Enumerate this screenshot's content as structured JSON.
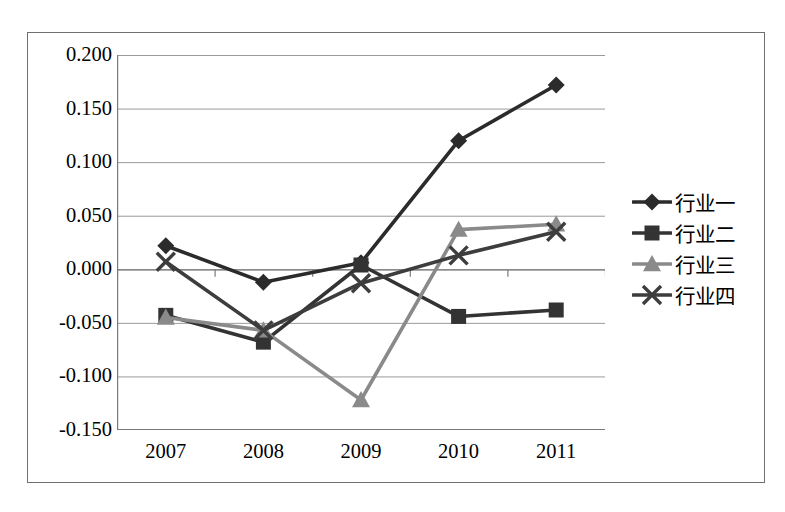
{
  "chart_data": {
    "type": "line",
    "title": "",
    "xlabel": "",
    "ylabel": "",
    "categories": [
      "2007",
      "2008",
      "2009",
      "2010",
      "2011"
    ],
    "ylim": [
      -0.15,
      0.2
    ],
    "ytick_step": 0.05,
    "ytick_labels": [
      "0.200",
      "0.150",
      "0.100",
      "0.050",
      "0.000",
      "-0.050",
      "-0.100",
      "-0.150"
    ],
    "ytick_values": [
      0.2,
      0.15,
      0.1,
      0.05,
      0.0,
      -0.05,
      -0.1,
      -0.15
    ],
    "grid": true,
    "legend_position": "right",
    "series": [
      {
        "name": "行业一",
        "marker": "diamond",
        "color": "#2b2b2b",
        "values": [
          0.022,
          -0.012,
          0.006,
          0.12,
          0.172
        ]
      },
      {
        "name": "行业二",
        "marker": "square",
        "color": "#333333",
        "values": [
          -0.043,
          -0.068,
          0.004,
          -0.044,
          -0.038
        ]
      },
      {
        "name": "行业三",
        "marker": "triangle",
        "color": "#8a8a8a",
        "values": [
          -0.045,
          -0.057,
          -0.122,
          0.037,
          0.042
        ]
      },
      {
        "name": "行业四",
        "marker": "cross",
        "color": "#3d3d3d",
        "values": [
          0.007,
          -0.057,
          -0.013,
          0.013,
          0.035
        ]
      }
    ]
  },
  "legend": {
    "items": [
      {
        "label": "行业一",
        "marker": "diamond",
        "color": "#2b2b2b"
      },
      {
        "label": "行业二",
        "marker": "square",
        "color": "#333333"
      },
      {
        "label": "行业三",
        "marker": "triangle",
        "color": "#8a8a8a"
      },
      {
        "label": "行业四",
        "marker": "cross",
        "color": "#3d3d3d"
      }
    ]
  },
  "style": {
    "frame_border": "#6f6f6f",
    "axis_line": "#7a7a7a",
    "grid_line": "#9a9a9a",
    "background": "#ffffff",
    "text": "#000000"
  }
}
